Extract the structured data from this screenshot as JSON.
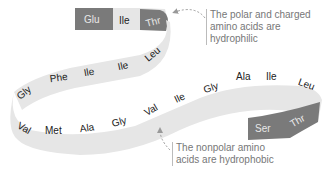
{
  "diagram": {
    "type": "amino acid chain ribbon",
    "colors": {
      "nonpolar_fill": "#e6e6e6",
      "nonpolar_text": "#222222",
      "polar_fill": "#7a7a7a",
      "polar_text": "#e8e8e8",
      "callout_text": "#777777",
      "arrow": "#999999"
    },
    "residues": [
      {
        "label": "Glu",
        "class": "polar"
      },
      {
        "label": "Ile",
        "class": "nonpolar"
      },
      {
        "label": "Thr",
        "class": "polar"
      },
      {
        "label": "Leu",
        "class": "nonpolar"
      },
      {
        "label": "Ile",
        "class": "nonpolar"
      },
      {
        "label": "Ile",
        "class": "nonpolar"
      },
      {
        "label": "Phe",
        "class": "nonpolar"
      },
      {
        "label": "Gly",
        "class": "nonpolar"
      },
      {
        "label": "Val",
        "class": "nonpolar"
      },
      {
        "label": "Met",
        "class": "nonpolar"
      },
      {
        "label": "Ala",
        "class": "nonpolar"
      },
      {
        "label": "Gly",
        "class": "nonpolar"
      },
      {
        "label": "Val",
        "class": "nonpolar"
      },
      {
        "label": "Ile",
        "class": "nonpolar"
      },
      {
        "label": "Gly",
        "class": "nonpolar"
      },
      {
        "label": "Ala",
        "class": "nonpolar"
      },
      {
        "label": "Ile",
        "class": "nonpolar"
      },
      {
        "label": "Leu",
        "class": "nonpolar"
      },
      {
        "label": "Thr",
        "class": "polar"
      },
      {
        "label": "Ser",
        "class": "polar"
      }
    ],
    "callouts": {
      "polar": [
        "The polar and charged",
        "amino acids are",
        "hydrophilic"
      ],
      "nonpolar": [
        "The nonpolar amino",
        "acids are hydrophobic"
      ]
    }
  }
}
